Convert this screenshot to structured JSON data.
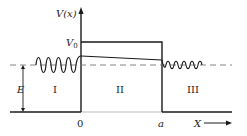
{
  "diagram": {
    "axis_y_label": "V(x)",
    "axis_x_label": "X",
    "barrier_height_label": "V",
    "barrier_height_subscript": "0",
    "energy_label": "E",
    "origin_label": "0",
    "barrier_width_label": "a",
    "regions": [
      {
        "id": "I",
        "label": "I"
      },
      {
        "id": "II",
        "label": "II"
      },
      {
        "id": "III",
        "label": "III"
      }
    ],
    "colors": {
      "line": "#1a1a1a",
      "dashed": "#777777",
      "background": "#ffffff"
    }
  }
}
